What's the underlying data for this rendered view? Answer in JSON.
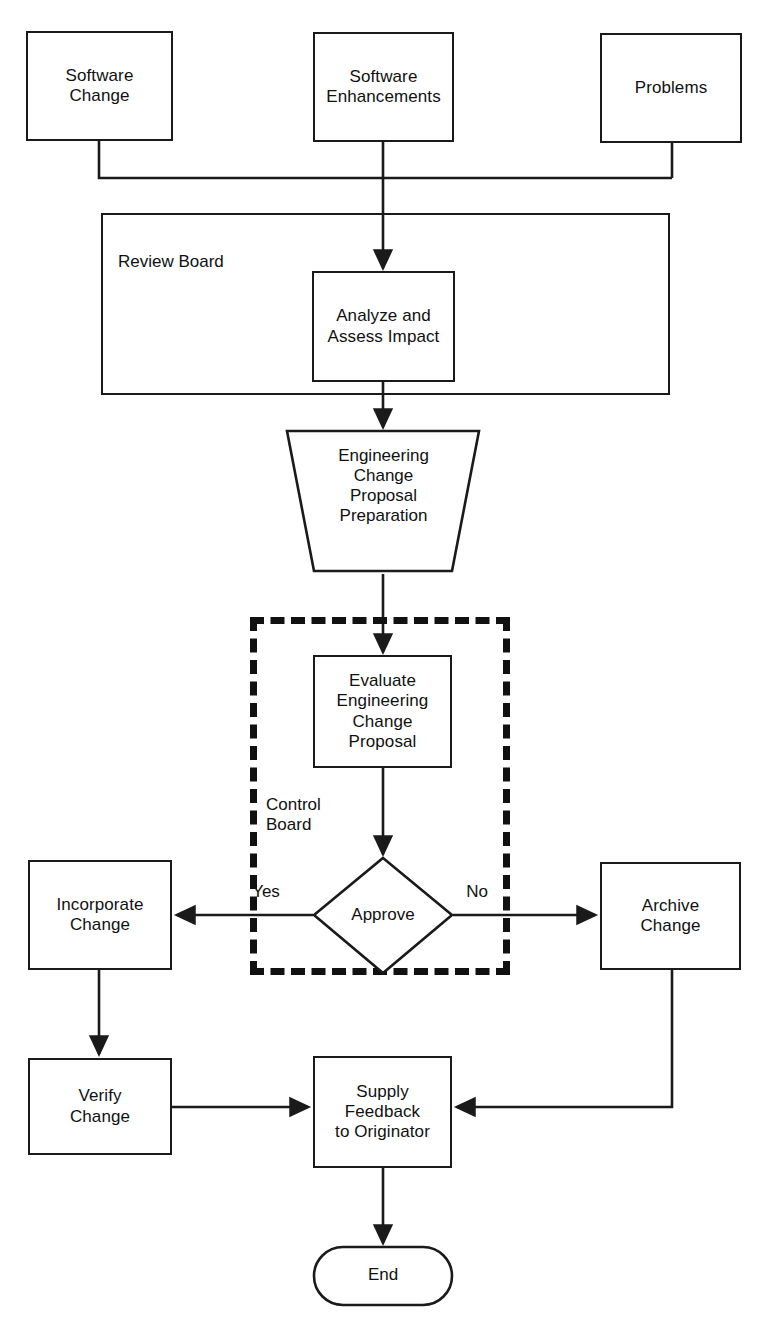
{
  "diagram": {
    "background_color": "#ffffff",
    "line_color": "#1a1a1a",
    "text_color": "#111111"
  },
  "nodes": {
    "software_change": {
      "label": "Software\nChange",
      "shape": "rectangle"
    },
    "software_enhancements": {
      "label": "Software\nEnhancements",
      "shape": "rectangle"
    },
    "problems": {
      "label": "Problems",
      "shape": "rectangle"
    },
    "review_board": {
      "label": "Review Board",
      "shape": "container-rectangle"
    },
    "analyze_assess": {
      "label": "Analyze and\nAssess Impact",
      "shape": "rectangle"
    },
    "ecp_preparation": {
      "label": "Engineering\nChange\nProposal\nPreparation",
      "shape": "trapezoid"
    },
    "control_board": {
      "label": "Control\nBoard",
      "shape": "dashed-container"
    },
    "evaluate_ecp": {
      "label": "Evaluate\nEngineering\nChange\nProposal",
      "shape": "rectangle"
    },
    "approve": {
      "label": "Approve",
      "shape": "diamond"
    },
    "incorporate_change": {
      "label": "Incorporate\nChange",
      "shape": "rectangle"
    },
    "archive_change": {
      "label": "Archive\nChange",
      "shape": "rectangle"
    },
    "verify_change": {
      "label": "Verify\nChange",
      "shape": "rectangle"
    },
    "supply_feedback": {
      "label": "Supply\nFeedback\nto Originator",
      "shape": "rectangle"
    },
    "end": {
      "label": "End",
      "shape": "terminator"
    }
  },
  "edge_labels": {
    "yes": "Yes",
    "no": "No"
  },
  "flow": [
    {
      "from": "software_change",
      "to": "review_board"
    },
    {
      "from": "software_enhancements",
      "to": "analyze_assess"
    },
    {
      "from": "problems",
      "to": "review_board"
    },
    {
      "from": "analyze_assess",
      "to": "ecp_preparation"
    },
    {
      "from": "ecp_preparation",
      "to": "evaluate_ecp"
    },
    {
      "from": "evaluate_ecp",
      "to": "approve"
    },
    {
      "from": "approve",
      "to": "incorporate_change",
      "label": "Yes"
    },
    {
      "from": "approve",
      "to": "archive_change",
      "label": "No"
    },
    {
      "from": "incorporate_change",
      "to": "verify_change"
    },
    {
      "from": "verify_change",
      "to": "supply_feedback"
    },
    {
      "from": "archive_change",
      "to": "supply_feedback"
    },
    {
      "from": "supply_feedback",
      "to": "end"
    }
  ]
}
